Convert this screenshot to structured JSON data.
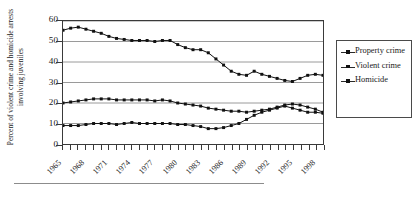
{
  "figure": {
    "ylabel": "Percent of violent crime and homicide arrests involving juveniles",
    "bottom_rule": true
  },
  "legend": {
    "position": "right",
    "items": [
      {
        "label": "Property crime",
        "marker": "square-marker-icon"
      },
      {
        "label": "Violent crime",
        "marker": "square-marker-icon"
      },
      {
        "label": "Homicide",
        "marker": "square-marker-icon"
      }
    ]
  },
  "chart_data": {
    "type": "line",
    "title": "",
    "xlabel": "",
    "ylabel": "Percent of violent crime and homicide arrests involving juveniles",
    "ylim": [
      0,
      60
    ],
    "yticks": [
      0,
      10,
      20,
      30,
      40,
      50,
      60
    ],
    "xlim": [
      1965,
      1999
    ],
    "xticks": [
      1965,
      1968,
      1971,
      1974,
      1977,
      1980,
      1983,
      1986,
      1989,
      1992,
      1995,
      1998
    ],
    "xtick_labels": [
      "1965",
      "1968",
      "1971",
      "1974",
      "1977",
      "1980",
      "1983",
      "1986",
      "1989",
      "1992",
      "1995",
      "1998"
    ],
    "grid": "horizontal",
    "legend_position": "right",
    "marker": "square",
    "color": "#111111",
    "x": [
      1965,
      1966,
      1967,
      1968,
      1969,
      1970,
      1971,
      1972,
      1973,
      1974,
      1975,
      1976,
      1977,
      1978,
      1979,
      1980,
      1981,
      1982,
      1983,
      1984,
      1985,
      1986,
      1987,
      1988,
      1989,
      1990,
      1991,
      1992,
      1993,
      1994,
      1995,
      1996,
      1997,
      1998,
      1999
    ],
    "series": [
      {
        "name": "Property crime",
        "values": [
          55.5,
          56.5,
          57.0,
          56.0,
          55.0,
          54.0,
          52.5,
          51.5,
          51.0,
          50.5,
          50.5,
          50.5,
          50.0,
          50.5,
          50.5,
          48.5,
          47.0,
          46.0,
          46.0,
          44.5,
          41.5,
          38.5,
          35.5,
          34.0,
          33.5,
          35.5,
          34.0,
          33.0,
          32.0,
          31.0,
          30.5,
          32.0,
          33.5,
          34.0,
          33.5
        ]
      },
      {
        "name": "Violent crime",
        "values": [
          20.0,
          20.5,
          21.0,
          21.5,
          22.0,
          22.0,
          22.0,
          21.5,
          21.5,
          21.5,
          21.5,
          21.5,
          21.0,
          21.5,
          21.0,
          20.0,
          19.5,
          19.0,
          18.5,
          17.5,
          17.0,
          16.5,
          16.0,
          16.0,
          15.5,
          16.0,
          16.5,
          17.0,
          18.0,
          19.0,
          19.5,
          19.0,
          18.0,
          17.0,
          15.5
        ]
      },
      {
        "name": "Homicide",
        "values": [
          9.0,
          9.0,
          9.0,
          9.5,
          10.0,
          10.0,
          10.0,
          9.5,
          10.0,
          10.5,
          10.0,
          10.0,
          10.0,
          10.0,
          10.0,
          9.5,
          9.5,
          9.0,
          8.5,
          7.5,
          7.5,
          8.0,
          9.0,
          10.0,
          12.0,
          14.0,
          15.5,
          16.5,
          17.5,
          18.5,
          17.5,
          16.5,
          15.5,
          15.5,
          15.0
        ]
      }
    ]
  }
}
